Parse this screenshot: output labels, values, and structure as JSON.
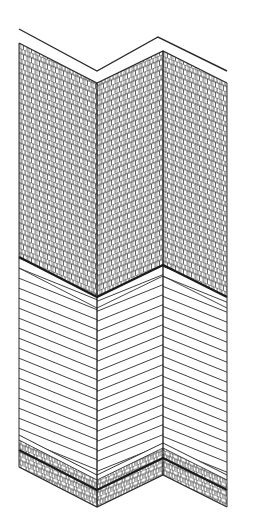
{
  "diagram": {
    "title": "Exterior wall corner elevation",
    "zones": [
      {
        "name": "cap",
        "label": "Top trim / cap"
      },
      {
        "name": "shingles",
        "label": "Shingle siding (upper wall)"
      },
      {
        "name": "clapboard",
        "label": "Horizontal lap siding (lower wall)"
      },
      {
        "name": "base",
        "label": "Masonry base / foundation band"
      }
    ],
    "colors": {
      "line": "#2a2a2a",
      "fill": "#ffffff"
    }
  }
}
